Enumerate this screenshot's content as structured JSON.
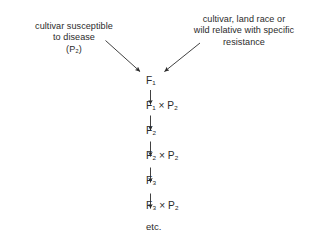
{
  "diagram": {
    "background_color": "#ffffff",
    "text_color": "#2b2b2b",
    "captions": {
      "left": "cultivar susceptible\nto disease\n(P₂)",
      "right": "cultivar, land race or\nwild relative with specific\nresistance"
    },
    "chain": [
      {
        "id": "f1",
        "label": "F₁"
      },
      {
        "id": "f1xp2",
        "label": "F₁ × P₂"
      },
      {
        "id": "f2",
        "label": "F₂"
      },
      {
        "id": "f2xp2",
        "label": "F₂ × P₂"
      },
      {
        "id": "f3",
        "label": "F₃"
      },
      {
        "id": "f3xp2",
        "label": "F₃ × P₂"
      },
      {
        "id": "etc",
        "label": "etc."
      }
    ],
    "arrows": {
      "left_diagonal": "from left parent caption down-right to F₁",
      "right_diagonal": "from right parent caption down-left to F₁",
      "vertical": "F₁ → F₁ × P₂ → F₂ → F₂ × P₂ → F₃ → F₃ × P₂"
    }
  }
}
